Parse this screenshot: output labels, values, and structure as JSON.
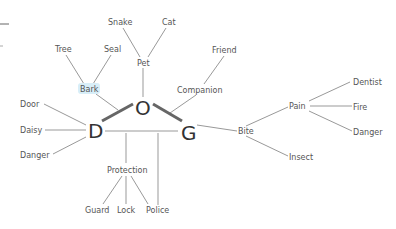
{
  "diagram": {
    "type": "mind-map",
    "core": [
      {
        "id": "D",
        "label": "D",
        "x": 95,
        "y": 131
      },
      {
        "id": "O",
        "label": "O",
        "x": 143,
        "y": 108
      },
      {
        "id": "G",
        "label": "G",
        "x": 189,
        "y": 132
      }
    ],
    "nodes": [
      {
        "id": "snake",
        "label": "Snake",
        "x": 119,
        "y": 22
      },
      {
        "id": "cat",
        "label": "Cat",
        "x": 169,
        "y": 22
      },
      {
        "id": "tree",
        "label": "Tree",
        "x": 63,
        "y": 49
      },
      {
        "id": "seal",
        "label": "Seal",
        "x": 112,
        "y": 49
      },
      {
        "id": "pet",
        "label": "Pet",
        "x": 143,
        "y": 63
      },
      {
        "id": "friend",
        "label": "Friend",
        "x": 225,
        "y": 50
      },
      {
        "id": "bark",
        "label": "Bark",
        "x": 88,
        "y": 90
      },
      {
        "id": "companion",
        "label": "Companion",
        "x": 199,
        "y": 90
      },
      {
        "id": "door",
        "label": "Door",
        "x": 30,
        "y": 104
      },
      {
        "id": "daisy",
        "label": "Daisy",
        "x": 30,
        "y": 130
      },
      {
        "id": "danger_l",
        "label": "Danger",
        "x": 34,
        "y": 155
      },
      {
        "id": "dentist",
        "label": "Dentist",
        "x": 367,
        "y": 82
      },
      {
        "id": "pain",
        "label": "Pain",
        "x": 298,
        "y": 106
      },
      {
        "id": "fire",
        "label": "Fire",
        "x": 359,
        "y": 107
      },
      {
        "id": "danger_r",
        "label": "Danger",
        "x": 366,
        "y": 132
      },
      {
        "id": "bite",
        "label": "Bite",
        "x": 245,
        "y": 131
      },
      {
        "id": "insect",
        "label": "Insect",
        "x": 301,
        "y": 157
      },
      {
        "id": "protection",
        "label": "Protection",
        "x": 126,
        "y": 170
      },
      {
        "id": "guard",
        "label": "Guard",
        "x": 98,
        "y": 210
      },
      {
        "id": "lock",
        "label": "Lock",
        "x": 126,
        "y": 210
      },
      {
        "id": "police",
        "label": "Police",
        "x": 158,
        "y": 210
      }
    ],
    "edges": [
      [
        "snake",
        "pet"
      ],
      [
        "cat",
        "pet"
      ],
      [
        "pet",
        "O"
      ],
      [
        "tree",
        "bark"
      ],
      [
        "seal",
        "bark"
      ],
      [
        "bark",
        "O"
      ],
      [
        "friend",
        "companion"
      ],
      [
        "companion",
        "G"
      ],
      [
        "door",
        "D"
      ],
      [
        "daisy",
        "D"
      ],
      [
        "danger_l",
        "D"
      ],
      [
        "G",
        "bite"
      ],
      [
        "bite",
        "pain"
      ],
      [
        "bite",
        "insect"
      ],
      [
        "pain",
        "dentist"
      ],
      [
        "pain",
        "fire"
      ],
      [
        "pain",
        "danger_r"
      ],
      [
        "D",
        "G"
      ],
      [
        "protection",
        "guard"
      ],
      [
        "protection",
        "lock"
      ],
      [
        "protection",
        "police"
      ]
    ],
    "strong_edges": [
      [
        "D",
        "O"
      ],
      [
        "O",
        "G"
      ]
    ],
    "highlight": {
      "node": "bark",
      "color": "#d8eef8"
    }
  }
}
